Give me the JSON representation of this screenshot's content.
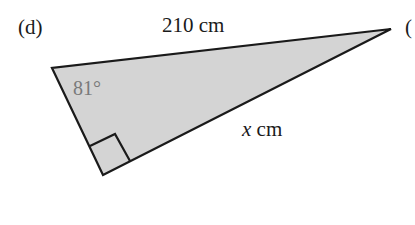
{
  "figure": {
    "part_label": "(d)",
    "next_part_label_partial": "(",
    "triangle": {
      "fill_color": "#d4d4d4",
      "stroke_color": "#1a1a1a",
      "vertices": {
        "left": [
          52,
          68
        ],
        "right_angle": [
          103,
          175
        ],
        "apex": [
          391,
          29
        ]
      },
      "hypotenuse_label": "210 cm",
      "angle_label": "81°",
      "side_label_var": "x",
      "side_label_unit": " cm",
      "right_angle_marker": true
    }
  }
}
